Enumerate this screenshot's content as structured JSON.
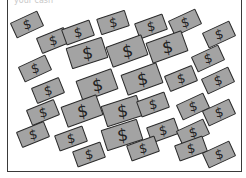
{
  "caption": "your cash",
  "illustration": {
    "description": "Scattered gray dollar bills inside a box",
    "bill_color": "#a3a3a3",
    "outline_color": "#2a2a2a",
    "symbol": "$",
    "bills": [
      {
        "x": 4,
        "y": 16,
        "r": -25,
        "big": false
      },
      {
        "x": 30,
        "y": 32,
        "r": -22,
        "big": false
      },
      {
        "x": 55,
        "y": 24,
        "r": -20,
        "big": false
      },
      {
        "x": 90,
        "y": 14,
        "r": -18,
        "big": false
      },
      {
        "x": 128,
        "y": 18,
        "r": -20,
        "big": false
      },
      {
        "x": 162,
        "y": 14,
        "r": -25,
        "big": false
      },
      {
        "x": 196,
        "y": 26,
        "r": -25,
        "big": false
      },
      {
        "x": 60,
        "y": 42,
        "r": -18,
        "big": true
      },
      {
        "x": 100,
        "y": 40,
        "r": -20,
        "big": true
      },
      {
        "x": 140,
        "y": 36,
        "r": -20,
        "big": true
      },
      {
        "x": 185,
        "y": 50,
        "r": -25,
        "big": false
      },
      {
        "x": 12,
        "y": 60,
        "r": -25,
        "big": false
      },
      {
        "x": 25,
        "y": 82,
        "r": -22,
        "big": false
      },
      {
        "x": 70,
        "y": 74,
        "r": -20,
        "big": true
      },
      {
        "x": 115,
        "y": 68,
        "r": -20,
        "big": true
      },
      {
        "x": 158,
        "y": 70,
        "r": -22,
        "big": false
      },
      {
        "x": 195,
        "y": 72,
        "r": -25,
        "big": false
      },
      {
        "x": 20,
        "y": 104,
        "r": -22,
        "big": false
      },
      {
        "x": 55,
        "y": 100,
        "r": -20,
        "big": true
      },
      {
        "x": 95,
        "y": 100,
        "r": -18,
        "big": true
      },
      {
        "x": 130,
        "y": 96,
        "r": -20,
        "big": false
      },
      {
        "x": 170,
        "y": 98,
        "r": -25,
        "big": false
      },
      {
        "x": 196,
        "y": 104,
        "r": -25,
        "big": false
      },
      {
        "x": 10,
        "y": 126,
        "r": -22,
        "big": false
      },
      {
        "x": 48,
        "y": 130,
        "r": -20,
        "big": false
      },
      {
        "x": 95,
        "y": 124,
        "r": -18,
        "big": true
      },
      {
        "x": 140,
        "y": 122,
        "r": -20,
        "big": false
      },
      {
        "x": 170,
        "y": 124,
        "r": -25,
        "big": false
      },
      {
        "x": 66,
        "y": 146,
        "r": -20,
        "big": false
      },
      {
        "x": 120,
        "y": 140,
        "r": -20,
        "big": false
      },
      {
        "x": 168,
        "y": 140,
        "r": -20,
        "big": false
      },
      {
        "x": 196,
        "y": 146,
        "r": -25,
        "big": false
      }
    ]
  }
}
